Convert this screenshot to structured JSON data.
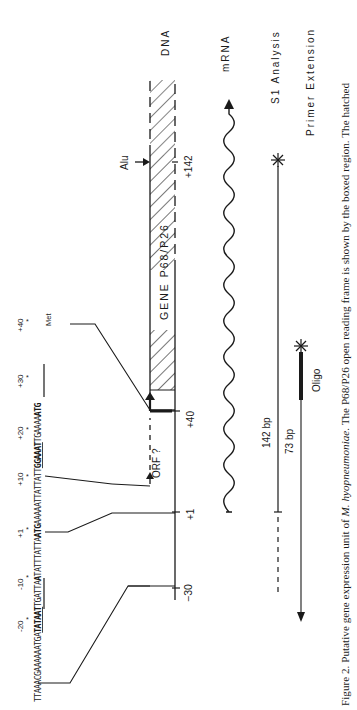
{
  "figure": {
    "orientation": "rotated-90-ccw",
    "tracks": {
      "dna": "DNA",
      "mrna": "mRNA",
      "s1": "S1 Analysis",
      "primer": "Primer Extension"
    },
    "gene_label": "GENE  P68/P26",
    "orf_label": "ORF ?",
    "alu_label": "Alu",
    "positions": {
      "minus30": "−30",
      "plus1": "+1",
      "plus40": "+40",
      "plus142": "+142"
    },
    "sequence": {
      "ticks": [
        "-20",
        "-10",
        "+1",
        "+10",
        "+20",
        "+30",
        "+40"
      ],
      "segments": [
        {
          "text": "TTAAACGAAAAAATGA",
          "bold": false,
          "underline": false
        },
        {
          "text": "TATAAT",
          "bold": true,
          "underline": true
        },
        {
          "text": "TGATTA",
          "bold": false,
          "underline": false
        },
        {
          "text": "A",
          "bold": true,
          "underline": false
        },
        {
          "text": "TATTTATTA",
          "bold": false,
          "underline": false
        },
        {
          "text": "ATG",
          "bold": true,
          "underline": false
        },
        {
          "text": "AAAAATTATTATT",
          "bold": false,
          "underline": false
        },
        {
          "text": "GGAAAT",
          "bold": true,
          "underline": true
        },
        {
          "text": "TGAAAA",
          "bold": false,
          "underline": false
        },
        {
          "text": "ATG",
          "bold": true,
          "underline": false
        }
      ],
      "met_label": "Met"
    },
    "s1_length": "142 bp",
    "primer_length": "73 bp",
    "oligo_label": "Oligo",
    "caption_prefix": "Figure 2. Putative gene expression unit of ",
    "caption_species": "M. hyopneumoniae",
    "caption_suffix": ". The P68/P26 open reading frame is shown by the boxed region. The hatched"
  }
}
